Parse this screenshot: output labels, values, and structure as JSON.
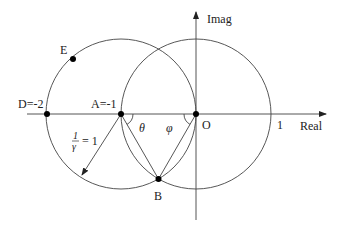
{
  "diagram": {
    "axes": {
      "real_label": "Real",
      "imag_label": "Imag",
      "tick_one_label": "1"
    },
    "points": {
      "D": {
        "label": "D=-2",
        "value": -2
      },
      "A": {
        "label": "A=-1",
        "value": -1
      },
      "O": {
        "label": "O",
        "value": 0
      },
      "B": {
        "label": "B"
      },
      "E": {
        "label": "E"
      }
    },
    "angles": {
      "theta": "θ",
      "phi": "φ"
    },
    "radius_annotation": {
      "numerator": "1",
      "denominator": "γ",
      "rhs": "= 1"
    },
    "circles": [
      {
        "name": "left-circle",
        "center": -1,
        "radius": 1
      },
      {
        "name": "right-circle",
        "center": 0,
        "radius": 1
      }
    ],
    "colors": {
      "stroke": "#333333",
      "point": "#000000"
    }
  }
}
